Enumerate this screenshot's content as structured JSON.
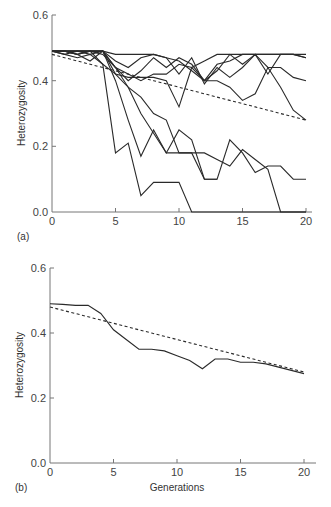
{
  "chart_data": [
    {
      "type": "line",
      "panel_label": "(a)",
      "title": "",
      "xlabel": "",
      "ylabel": "Heterozygosity",
      "xlim": [
        0,
        20
      ],
      "ylim": [
        0,
        0.6
      ],
      "xticks": [
        0,
        5,
        10,
        15,
        20
      ],
      "yticks": [
        0.0,
        0.2,
        0.4,
        0.6
      ],
      "ytick_labels": [
        "0.0",
        "0.2",
        "0.4",
        "0.6"
      ],
      "grid": false,
      "legend": null,
      "x": [
        0,
        1,
        2,
        3,
        4,
        5,
        6,
        7,
        8,
        9,
        10,
        11,
        12,
        13,
        14,
        15,
        16,
        17,
        18,
        19,
        20
      ],
      "series": [
        {
          "name": "replicate-1",
          "style": "solid",
          "values": [
            0.49,
            0.49,
            0.49,
            0.49,
            0.45,
            0.18,
            0.21,
            0.05,
            0.09,
            0.09,
            0.09,
            0.0,
            0.0,
            0.0,
            0.0,
            0.0,
            0.0,
            0.0,
            0.0,
            0.0,
            0.0
          ]
        },
        {
          "name": "replicate-2",
          "style": "solid",
          "values": [
            0.49,
            0.49,
            0.48,
            0.49,
            0.49,
            0.4,
            0.28,
            0.17,
            0.25,
            0.18,
            0.18,
            0.18,
            0.1,
            0.1,
            null,
            null,
            null,
            null,
            null,
            null,
            null
          ]
        },
        {
          "name": "replicate-3",
          "style": "solid",
          "values": [
            0.49,
            0.48,
            0.49,
            0.49,
            0.49,
            0.42,
            0.38,
            0.3,
            0.24,
            0.18,
            0.25,
            0.22,
            0.1,
            0.1,
            0.22,
            0.18,
            0.12,
            0.14,
            0.14,
            0.1,
            0.1
          ]
        },
        {
          "name": "replicate-4",
          "style": "solid",
          "values": [
            0.49,
            0.49,
            0.49,
            0.49,
            0.48,
            0.44,
            0.38,
            0.35,
            0.3,
            0.28,
            0.18,
            0.18,
            0.18,
            0.16,
            0.14,
            0.19,
            0.16,
            0.13,
            0.0,
            0.0,
            0.0
          ]
        },
        {
          "name": "replicate-5",
          "style": "solid",
          "values": [
            0.49,
            0.49,
            0.49,
            0.48,
            0.49,
            0.44,
            0.4,
            0.43,
            0.47,
            0.44,
            0.47,
            0.45,
            0.4,
            0.45,
            0.46,
            0.48,
            0.48,
            0.48,
            0.48,
            0.48,
            0.47
          ]
        },
        {
          "name": "replicate-6",
          "style": "solid",
          "values": [
            0.49,
            0.49,
            0.48,
            0.49,
            0.49,
            0.46,
            0.44,
            0.47,
            0.48,
            0.47,
            0.46,
            0.43,
            0.4,
            0.43,
            0.48,
            0.45,
            0.48,
            0.44,
            0.44,
            0.41,
            0.4
          ]
        },
        {
          "name": "replicate-7",
          "style": "solid",
          "values": [
            0.49,
            0.49,
            0.48,
            0.46,
            0.49,
            0.44,
            0.42,
            0.4,
            0.42,
            0.42,
            0.45,
            0.44,
            0.4,
            0.4,
            0.38,
            0.34,
            0.36,
            0.44,
            0.38,
            0.31,
            0.28
          ]
        },
        {
          "name": "replicate-8",
          "style": "solid",
          "values": [
            0.49,
            0.49,
            0.49,
            0.49,
            0.49,
            0.48,
            0.48,
            0.48,
            0.48,
            0.47,
            0.42,
            0.47,
            0.39,
            0.44,
            0.41,
            0.44,
            0.48,
            0.42,
            0.48,
            0.48,
            0.47
          ]
        },
        {
          "name": "replicate-9",
          "style": "solid",
          "values": [
            0.49,
            0.48,
            0.47,
            0.48,
            0.45,
            0.42,
            0.41,
            0.41,
            0.41,
            0.4,
            0.32,
            0.44,
            0.46,
            0.48,
            0.48,
            0.48,
            0.48,
            0.48,
            0.48,
            0.48,
            0.48
          ]
        },
        {
          "name": "expected",
          "style": "dashed",
          "values": [
            0.48,
            0.47,
            0.46,
            0.45,
            0.44,
            0.43,
            0.42,
            0.41,
            0.4,
            0.39,
            0.38,
            0.37,
            0.36,
            0.35,
            0.34,
            0.33,
            0.32,
            0.31,
            0.3,
            0.29,
            0.28
          ]
        }
      ]
    },
    {
      "type": "line",
      "panel_label": "(b)",
      "title": "",
      "xlabel": "Generations",
      "ylabel": "Heterozygosity",
      "xlim": [
        0,
        20
      ],
      "ylim": [
        0,
        0.6
      ],
      "xticks": [
        0,
        5,
        10,
        15,
        20
      ],
      "yticks": [
        0.0,
        0.2,
        0.4,
        0.6
      ],
      "ytick_labels": [
        "0.0",
        "0.2",
        "0.4",
        "0.6"
      ],
      "grid": false,
      "legend": null,
      "x": [
        0,
        1,
        2,
        3,
        4,
        5,
        6,
        7,
        8,
        9,
        10,
        11,
        12,
        13,
        14,
        15,
        16,
        17,
        18,
        19,
        20
      ],
      "series": [
        {
          "name": "mean",
          "style": "solid",
          "values": [
            0.49,
            0.488,
            0.485,
            0.485,
            0.46,
            0.41,
            0.38,
            0.35,
            0.35,
            0.345,
            0.33,
            0.315,
            0.29,
            0.32,
            0.32,
            0.31,
            0.31,
            0.305,
            0.295,
            0.285,
            0.275
          ]
        },
        {
          "name": "expected",
          "style": "dashed",
          "values": [
            0.48,
            0.47,
            0.46,
            0.45,
            0.44,
            0.43,
            0.42,
            0.41,
            0.4,
            0.39,
            0.38,
            0.37,
            0.36,
            0.35,
            0.34,
            0.33,
            0.32,
            0.31,
            0.3,
            0.29,
            0.28
          ]
        }
      ]
    }
  ],
  "panels": {
    "a": {
      "label": "(a)",
      "ylabel": "Heterozygosity",
      "xtick_labels": [
        "0",
        "5",
        "10",
        "15",
        "20"
      ],
      "ytick_labels": [
        "0.0",
        "0.2",
        "0.4",
        "0.6"
      ]
    },
    "b": {
      "label": "(b)",
      "ylabel": "Heterozygosity",
      "xlabel": "Generations",
      "xtick_labels": [
        "0",
        "5",
        "10",
        "15",
        "20"
      ],
      "ytick_labels": [
        "0.0",
        "0.2",
        "0.4",
        "0.6"
      ]
    }
  },
  "colors": {
    "line": "#2a2a2a",
    "axis": "#777777",
    "text": "#444444"
  }
}
